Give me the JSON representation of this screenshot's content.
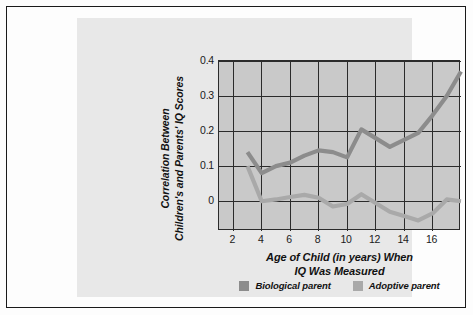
{
  "chart_data": {
    "type": "line",
    "title": "",
    "xlabel": "Age of Child (in years) When IQ Was Measured",
    "ylabel": "Correlation Between Children's and Parents' IQ Scores",
    "xlabel_lines": [
      "Age of Child (in years) When",
      "IQ Was Measured"
    ],
    "ylabel_lines": [
      "Correlation Between",
      "Children's and Parents' IQ Scores"
    ],
    "xlim": [
      1,
      18
    ],
    "ylim": [
      -0.085,
      0.4
    ],
    "xticks": [
      2,
      4,
      6,
      8,
      10,
      12,
      14,
      16
    ],
    "yticks": [
      0.4,
      0.3,
      0.2,
      0.1,
      0
    ],
    "ytick_labels": [
      "0.4",
      "0.3",
      "0.2",
      "0.1",
      "0"
    ],
    "xtick_labels": [
      "2",
      "4",
      "6",
      "8",
      "10",
      "12",
      "14",
      "16"
    ],
    "grid": true,
    "legend_position": "bottom-center",
    "x": [
      3,
      4,
      5,
      6,
      7,
      8,
      9,
      10,
      11,
      12,
      13,
      14,
      15,
      16,
      17,
      18
    ],
    "series": [
      {
        "name": "Biological parent",
        "color": "#8c8c8c",
        "values": [
          0.14,
          0.08,
          0.1,
          0.11,
          0.13,
          0.145,
          0.14,
          0.125,
          0.205,
          0.18,
          0.155,
          0.175,
          0.195,
          0.245,
          0.3,
          0.37
        ]
      },
      {
        "name": "Adoptive parent",
        "color": "#a9a9a9",
        "values": [
          0.1,
          0.0,
          0.005,
          0.012,
          0.018,
          0.01,
          -0.015,
          -0.008,
          0.02,
          -0.005,
          -0.03,
          -0.042,
          -0.055,
          -0.035,
          0.005,
          0.0
        ]
      }
    ]
  },
  "legend": {
    "entries": [
      {
        "label": "Biological parent",
        "color": "#8c8c8c"
      },
      {
        "label": "Adoptive parent",
        "color": "#a9a9a9"
      }
    ]
  },
  "colors": {
    "page_background": "#fdfdfd",
    "panel_background": "#e8e8e8",
    "plot_background": "#c9c9c9",
    "grid": "#2b2b2b",
    "border": "#1a1a1a",
    "text": "#111111"
  }
}
